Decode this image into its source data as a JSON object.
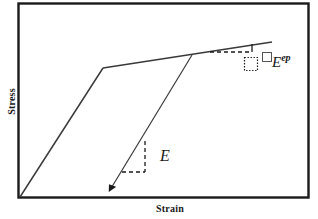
{
  "figure": {
    "name": "stress-strain-elastoplastic-diagram",
    "background_color": "#ffffff",
    "line_color": "#2b2b2b",
    "border_color": "#1a1a1a"
  },
  "axes": {
    "ylabel": "Stress",
    "xlabel": "Strain"
  },
  "annotations": {
    "elastic_modulus": "E",
    "elastoplastic_modulus_base": "E",
    "elastoplastic_modulus_sup": "ep"
  },
  "chart_data": {
    "type": "line",
    "title": "",
    "xlabel": "Strain",
    "ylabel": "Stress",
    "grid": false,
    "legend": null,
    "axis_ticks": {
      "x": [],
      "y": []
    },
    "axis_style": "arrowless-box-frame",
    "series": [
      {
        "name": "elastic-loading-branch",
        "style": "solid",
        "points": [
          [
            20,
            197
          ],
          [
            103,
            68
          ]
        ]
      },
      {
        "name": "plastic-hardening-branch",
        "style": "solid",
        "points": [
          [
            103,
            68
          ],
          [
            272,
            42
          ]
        ]
      },
      {
        "name": "elastic-unloading-branch",
        "style": "solid",
        "arrow": "end",
        "points": [
          [
            192,
            55
          ],
          [
            110,
            190
          ]
        ]
      }
    ],
    "slope_triangles": [
      {
        "name": "E-slope-triangle",
        "style": "dashed",
        "vertical": [
          [
            145,
            141
          ],
          [
            145,
            172
          ]
        ],
        "horizontal": [
          [
            122,
            172
          ],
          [
            145,
            172
          ]
        ]
      },
      {
        "name": "Eep-slope-triangle",
        "style": "dashed",
        "horizontal": [
          [
            210,
            52
          ],
          [
            252,
            52
          ]
        ],
        "vertical": [
          [
            252,
            44
          ],
          [
            252,
            52
          ]
        ]
      }
    ],
    "markers": [
      {
        "name": "dotted-square-marker",
        "style": "dotted",
        "x": 244,
        "y": 57,
        "w": 13,
        "h": 13
      },
      {
        "name": "open-square-marker",
        "style": "solid-thin",
        "x": 262,
        "y": 52,
        "w": 9,
        "h": 9
      }
    ]
  }
}
